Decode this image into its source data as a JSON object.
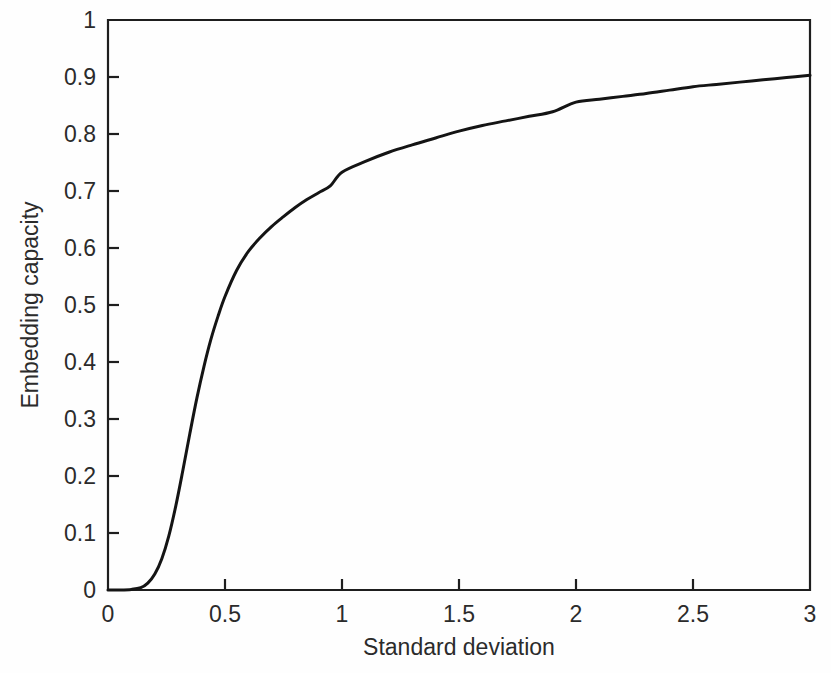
{
  "chart_data": {
    "type": "line",
    "title": "",
    "subtitle": "",
    "xlabel": "Standard deviation",
    "ylabel": "Embedding capacity",
    "xlim": [
      0,
      3
    ],
    "ylim": [
      0,
      1
    ],
    "grid": false,
    "legend": null,
    "legend_position": "none",
    "xticks": [
      0,
      0.5,
      1,
      1.5,
      2,
      2.5,
      3
    ],
    "xtick_labels": [
      "0",
      "0.5",
      "1",
      "1.5",
      "2",
      "2.5",
      "3"
    ],
    "yticks": [
      0,
      0.1,
      0.2,
      0.3,
      0.4,
      0.5,
      0.6,
      0.7,
      0.8,
      0.9,
      1
    ],
    "ytick_labels": [
      "0",
      "0.1",
      "0.2",
      "0.3",
      "0.4",
      "0.5",
      "0.6",
      "0.7",
      "0.8",
      "0.9",
      "1"
    ],
    "line_color": "#141414",
    "series": [
      {
        "name": "Embedding capacity",
        "x": [
          0,
          0.05,
          0.1,
          0.14,
          0.17,
          0.2,
          0.23,
          0.26,
          0.29,
          0.32,
          0.35,
          0.38,
          0.41,
          0.44,
          0.47,
          0.5,
          0.55,
          0.6,
          0.65,
          0.7,
          0.75,
          0.8,
          0.85,
          0.9,
          0.95,
          1.0,
          1.1,
          1.2,
          1.3,
          1.4,
          1.5,
          1.6,
          1.7,
          1.8,
          1.9,
          2.0,
          2.1,
          2.2,
          2.3,
          2.4,
          2.5,
          2.6,
          2.7,
          2.8,
          2.9,
          3.0
        ],
        "y": [
          0,
          0,
          0.001,
          0.004,
          0.012,
          0.028,
          0.055,
          0.095,
          0.148,
          0.21,
          0.275,
          0.337,
          0.392,
          0.44,
          0.48,
          0.515,
          0.561,
          0.594,
          0.618,
          0.638,
          0.655,
          0.671,
          0.685,
          0.697,
          0.709,
          0.733,
          0.752,
          0.768,
          0.781,
          0.793,
          0.805,
          0.815,
          0.823,
          0.831,
          0.839,
          0.856,
          0.861,
          0.866,
          0.871,
          0.877,
          0.883,
          0.887,
          0.891,
          0.895,
          0.899,
          0.903
        ]
      }
    ]
  },
  "axes": {
    "x_axis_name": "Standard deviation",
    "y_axis_name": "Embedding capacity"
  }
}
